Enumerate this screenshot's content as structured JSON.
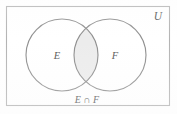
{
  "figure": {
    "type": "venn-diagram",
    "universe_label": "U",
    "set_left_label": "E",
    "set_right_label": "F",
    "caption": "E ∩ F",
    "colors": {
      "background": "#ffffff",
      "outline": "#8c8c8c",
      "rect_border": "#b0b0b0",
      "intersection_fill": "#ececec",
      "circle_fill": "#ffffff",
      "label_text": "#555555"
    },
    "geometry": {
      "rect": {
        "x": 6,
        "y": 6,
        "width": 164,
        "height": 100
      },
      "circle_left": {
        "cx": 62,
        "cy": 55,
        "r": 36
      },
      "circle_right": {
        "cx": 110,
        "cy": 55,
        "r": 36
      }
    }
  }
}
